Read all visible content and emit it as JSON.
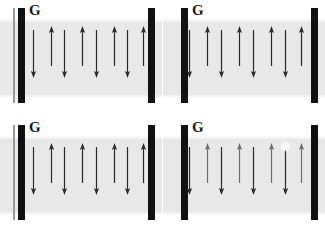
{
  "figure": {
    "width": 325,
    "height": 233,
    "background_color": "#ffffff",
    "layout": "2x2 grid of four panels"
  },
  "colors": {
    "channel_gray": "#e8e8e8",
    "electrode_black": "#111111",
    "guideline_gray": "#9a9a9a",
    "arrow_dark": "#2b2b2b",
    "arrow_light": "#6f6f6f",
    "label_color": "#1a1a1a",
    "background": "#ffffff"
  },
  "panels": [
    {
      "id": "panel-top-left",
      "position": "top-left",
      "label": "G",
      "has_guideline": true,
      "has_artifact": false,
      "arrows": [
        {
          "x": 33,
          "direction": "down",
          "length": 48,
          "top": 30,
          "shade": "dark"
        },
        {
          "x": 51,
          "direction": "up",
          "length": 40,
          "top": 26,
          "shade": "dark"
        },
        {
          "x": 64,
          "direction": "down",
          "length": 48,
          "top": 30,
          "shade": "dark"
        },
        {
          "x": 82,
          "direction": "up",
          "length": 40,
          "top": 26,
          "shade": "dark"
        },
        {
          "x": 96,
          "direction": "down",
          "length": 48,
          "top": 30,
          "shade": "dark"
        },
        {
          "x": 114,
          "direction": "up",
          "length": 40,
          "top": 26,
          "shade": "dark"
        },
        {
          "x": 127,
          "direction": "down",
          "length": 48,
          "top": 30,
          "shade": "dark"
        },
        {
          "x": 143,
          "direction": "up",
          "length": 40,
          "top": 26,
          "shade": "dark"
        }
      ]
    },
    {
      "id": "panel-top-right",
      "position": "top-right",
      "label": "G",
      "has_guideline": false,
      "has_artifact": false,
      "arrows": [
        {
          "x": 26,
          "direction": "down",
          "length": 48,
          "top": 30,
          "shade": "dark"
        },
        {
          "x": 44,
          "direction": "up",
          "length": 40,
          "top": 26,
          "shade": "dark"
        },
        {
          "x": 58,
          "direction": "down",
          "length": 48,
          "top": 30,
          "shade": "dark"
        },
        {
          "x": 76,
          "direction": "up",
          "length": 40,
          "top": 26,
          "shade": "dark"
        },
        {
          "x": 90,
          "direction": "down",
          "length": 48,
          "top": 30,
          "shade": "dark"
        },
        {
          "x": 108,
          "direction": "up",
          "length": 40,
          "top": 26,
          "shade": "dark"
        },
        {
          "x": 122,
          "direction": "down",
          "length": 48,
          "top": 30,
          "shade": "dark"
        },
        {
          "x": 138,
          "direction": "up",
          "length": 40,
          "top": 26,
          "shade": "dark"
        }
      ]
    },
    {
      "id": "panel-bottom-left",
      "position": "bottom-left",
      "label": "G",
      "has_guideline": true,
      "has_artifact": false,
      "arrows": [
        {
          "x": 33,
          "direction": "down",
          "length": 48,
          "top": 30,
          "shade": "dark"
        },
        {
          "x": 51,
          "direction": "up",
          "length": 40,
          "top": 26,
          "shade": "dark"
        },
        {
          "x": 64,
          "direction": "down",
          "length": 48,
          "top": 30,
          "shade": "dark"
        },
        {
          "x": 82,
          "direction": "up",
          "length": 40,
          "top": 26,
          "shade": "dark"
        },
        {
          "x": 96,
          "direction": "down",
          "length": 48,
          "top": 30,
          "shade": "dark"
        },
        {
          "x": 114,
          "direction": "up",
          "length": 40,
          "top": 26,
          "shade": "dark"
        },
        {
          "x": 127,
          "direction": "down",
          "length": 48,
          "top": 30,
          "shade": "dark"
        },
        {
          "x": 143,
          "direction": "up",
          "length": 40,
          "top": 26,
          "shade": "dark"
        }
      ]
    },
    {
      "id": "panel-bottom-right",
      "position": "bottom-right",
      "label": "G",
      "has_guideline": false,
      "has_artifact": true,
      "artifact": {
        "x": 119,
        "y": 26
      },
      "arrows": [
        {
          "x": 26,
          "direction": "down",
          "length": 48,
          "top": 30,
          "shade": "dark"
        },
        {
          "x": 44,
          "direction": "up",
          "length": 40,
          "top": 26,
          "shade": "light"
        },
        {
          "x": 58,
          "direction": "down",
          "length": 48,
          "top": 30,
          "shade": "dark"
        },
        {
          "x": 76,
          "direction": "up",
          "length": 40,
          "top": 26,
          "shade": "light"
        },
        {
          "x": 90,
          "direction": "down",
          "length": 48,
          "top": 30,
          "shade": "dark"
        },
        {
          "x": 108,
          "direction": "up",
          "length": 40,
          "top": 26,
          "shade": "light"
        },
        {
          "x": 122,
          "direction": "down",
          "length": 48,
          "top": 30,
          "shade": "dark"
        },
        {
          "x": 138,
          "direction": "up",
          "length": 40,
          "top": 26,
          "shade": "light"
        }
      ]
    }
  ]
}
